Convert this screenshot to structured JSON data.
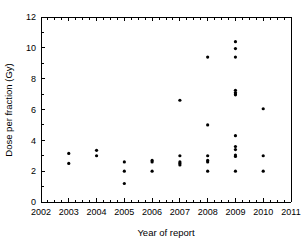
{
  "chart_data": {
    "type": "scatter",
    "title": "",
    "xlabel": "Year of report",
    "ylabel": "Dose per fraction (Gy)",
    "xlim": [
      2002,
      2011
    ],
    "ylim": [
      0,
      12
    ],
    "xticks": [
      2002,
      2003,
      2004,
      2005,
      2006,
      2007,
      2008,
      2009,
      2010,
      2011
    ],
    "xtick_labels": [
      "2002",
      "2003",
      "2004",
      "2005",
      "2006",
      "2007",
      "2008",
      "2009",
      "2010",
      "2011"
    ],
    "yticks": [
      0,
      2,
      4,
      6,
      8,
      10,
      12
    ],
    "ytick_labels": [
      "0",
      "2",
      "4",
      "6",
      "8",
      "10",
      "12"
    ],
    "x_minor_ticks_per_interval": 4,
    "y_minor_ticks_per_interval": 2,
    "grid": false,
    "legend": null,
    "marker": "circle",
    "marker_color": "#000000",
    "marker_size_px": 3.2,
    "points": [
      {
        "x": 2003,
        "y": 3.15
      },
      {
        "x": 2003,
        "y": 2.5
      },
      {
        "x": 2004,
        "y": 3.35
      },
      {
        "x": 2004,
        "y": 3.0
      },
      {
        "x": 2005,
        "y": 2.6
      },
      {
        "x": 2005,
        "y": 2.0
      },
      {
        "x": 2005,
        "y": 1.2
      },
      {
        "x": 2006,
        "y": 2.7
      },
      {
        "x": 2006,
        "y": 2.6
      },
      {
        "x": 2006,
        "y": 2.0
      },
      {
        "x": 2007,
        "y": 6.6
      },
      {
        "x": 2007,
        "y": 3.0
      },
      {
        "x": 2007,
        "y": 2.6
      },
      {
        "x": 2007,
        "y": 2.5
      },
      {
        "x": 2007,
        "y": 2.4
      },
      {
        "x": 2008,
        "y": 9.4
      },
      {
        "x": 2008,
        "y": 5.0
      },
      {
        "x": 2008,
        "y": 3.0
      },
      {
        "x": 2008,
        "y": 2.7
      },
      {
        "x": 2008,
        "y": 2.6
      },
      {
        "x": 2008,
        "y": 2.0
      },
      {
        "x": 2009,
        "y": 10.4
      },
      {
        "x": 2009,
        "y": 9.95
      },
      {
        "x": 2009,
        "y": 9.4
      },
      {
        "x": 2009,
        "y": 7.25
      },
      {
        "x": 2009,
        "y": 7.1
      },
      {
        "x": 2009,
        "y": 7.0
      },
      {
        "x": 2009,
        "y": 6.95
      },
      {
        "x": 2009,
        "y": 4.3
      },
      {
        "x": 2009,
        "y": 3.6
      },
      {
        "x": 2009,
        "y": 3.4
      },
      {
        "x": 2009,
        "y": 3.05
      },
      {
        "x": 2009,
        "y": 2.95
      },
      {
        "x": 2009,
        "y": 2.0
      },
      {
        "x": 2010,
        "y": 6.05
      },
      {
        "x": 2010,
        "y": 3.0
      },
      {
        "x": 2010,
        "y": 2.0
      }
    ]
  },
  "plot_geometry": {
    "left": 41,
    "right": 291,
    "top": 17,
    "bottom": 202
  }
}
